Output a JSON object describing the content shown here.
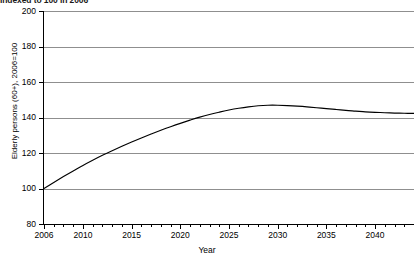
{
  "chart_data": {
    "type": "line",
    "title": "",
    "subtitle": "Indexed to 100 in 2006",
    "xlabel": "Year",
    "ylabel": "Elderly persons (60+), 2006=100",
    "xlim": [
      2006,
      2044
    ],
    "ylim": [
      80,
      200
    ],
    "yticks": [
      80,
      100,
      120,
      140,
      160,
      180,
      200
    ],
    "xticks": [
      2006,
      2010,
      2015,
      2020,
      2025,
      2030,
      2035,
      2040
    ],
    "xtick_labels": [
      "2006",
      "2010",
      "2015",
      "2020",
      "2025",
      "2030",
      "2035",
      "2040"
    ],
    "ytick_labels": [
      "80",
      "100",
      "120",
      "140",
      "160",
      "180",
      "200"
    ],
    "grid": "horizontal",
    "legend": "none",
    "series": [
      {
        "name": "Elderly persons (60+)",
        "color": "#000000",
        "x": [
          2006,
          2007,
          2008,
          2009,
          2010,
          2011,
          2012,
          2013,
          2014,
          2015,
          2016,
          2017,
          2018,
          2019,
          2020,
          2021,
          2022,
          2023,
          2024,
          2025,
          2026,
          2027,
          2028,
          2029,
          2030,
          2031,
          2032,
          2033,
          2034,
          2035,
          2036,
          2037,
          2038,
          2039,
          2040,
          2041,
          2042,
          2043,
          2044
        ],
        "values": [
          100.0,
          103.4,
          106.7,
          109.9,
          113.0,
          115.9,
          118.7,
          121.3,
          123.8,
          126.2,
          128.5,
          130.7,
          132.8,
          134.8,
          136.7,
          138.5,
          140.2,
          141.7,
          143.0,
          144.2,
          145.2,
          146.0,
          146.6,
          146.9,
          146.9,
          146.7,
          146.4,
          146.0,
          145.5,
          145.0,
          144.5,
          144.0,
          143.6,
          143.2,
          142.9,
          142.7,
          142.5,
          142.4,
          142.3
        ]
      }
    ]
  },
  "axis": {
    "x_title": "Year",
    "y_title": "Elderly persons (60+), 2006=100"
  },
  "header": {
    "subtitle": "Indexed to 100 in 2006"
  }
}
